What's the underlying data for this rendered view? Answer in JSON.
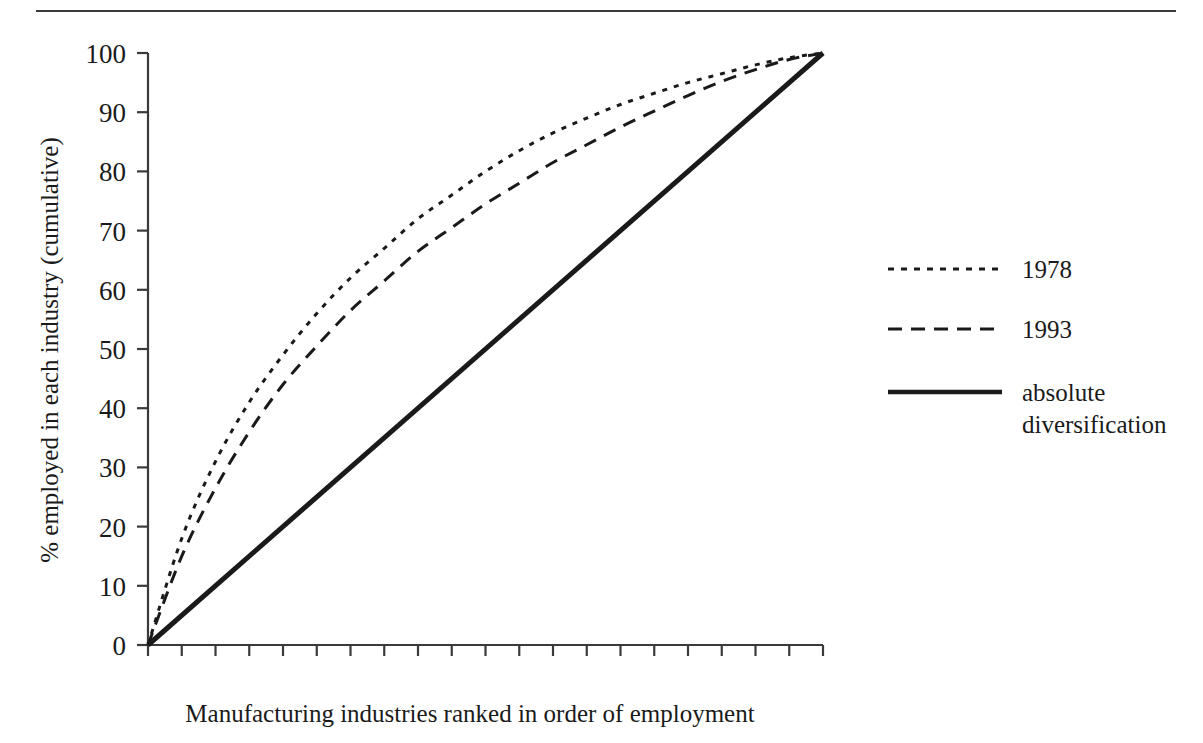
{
  "figure": {
    "has_top_rule": true,
    "background_color": "#ffffff",
    "ink_color": "#1a1a1a"
  },
  "chart_data": {
    "type": "line",
    "title": "",
    "subtitle": "",
    "xlabel": "Manufacturing industries ranked in order of employment",
    "ylabel": "% employed in each industry (cumulative)",
    "xlim": [
      0,
      20
    ],
    "ylim": [
      0,
      100
    ],
    "grid": false,
    "x_tick_labels": [],
    "x_tick_count": 20,
    "y_ticks": [
      0,
      10,
      20,
      30,
      40,
      50,
      60,
      70,
      80,
      90,
      100
    ],
    "y_tick_labels": [
      "0",
      "10",
      "20",
      "30",
      "40",
      "50",
      "60",
      "70",
      "80",
      "90",
      "100"
    ],
    "legend_position": "right",
    "x": [
      0,
      1,
      2,
      3,
      4,
      5,
      6,
      7,
      8,
      9,
      10,
      11,
      12,
      13,
      14,
      15,
      16,
      17,
      18,
      19,
      20
    ],
    "series": [
      {
        "name": "1978",
        "style": "dotted",
        "color": "#1a1a1a",
        "values": [
          0,
          18,
          31,
          41,
          49,
          56,
          62,
          67,
          72,
          76,
          80,
          83.5,
          86.5,
          89,
          91.3,
          93.2,
          95,
          96.5,
          98,
          99.2,
          100
        ]
      },
      {
        "name": "1993",
        "style": "dashed",
        "color": "#1a1a1a",
        "values": [
          0,
          15,
          26.5,
          36,
          44,
          50.5,
          56.5,
          61.5,
          66.5,
          70.5,
          74.5,
          78,
          81.5,
          84.5,
          87.5,
          90.2,
          92.8,
          95.2,
          97.2,
          98.9,
          100
        ]
      },
      {
        "name": "absolute diversification",
        "style": "solid",
        "color": "#1a1a1a",
        "values": [
          0,
          5,
          10,
          15,
          20,
          25,
          30,
          35,
          40,
          45,
          50,
          55,
          60,
          65,
          70,
          75,
          80,
          85,
          90,
          95,
          100
        ]
      }
    ]
  },
  "legend": {
    "entries": [
      {
        "label": "1978",
        "style": "dotted"
      },
      {
        "label": "1993",
        "style": "dashed"
      },
      {
        "label_line1": "absolute",
        "label_line2": "diversification",
        "style": "solid"
      }
    ]
  }
}
